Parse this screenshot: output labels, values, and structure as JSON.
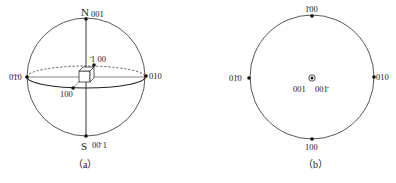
{
  "figure_a": {
    "caption": "（a）",
    "north_pole": {
      "letter": "N",
      "index": "001"
    },
    "south_pole": {
      "letter": "S",
      "index": "00̄ 1"
    },
    "labels": {
      "left": "0̄1̄0",
      "right": "010",
      "back": "̄1 00",
      "front": "100"
    }
  },
  "figure_b": {
    "caption": "（b）",
    "labels": {
      "top": "1̄00",
      "left": "01̄0",
      "right": "010",
      "bottom": "100",
      "center_upper": "001",
      "center_lower": "001̄"
    }
  }
}
